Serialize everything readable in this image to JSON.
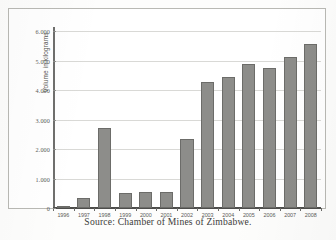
{
  "figure": {
    "caption": "Source: Chamber of Mines of Zimbabwe.",
    "frame_color": "#b9b9b4",
    "background": "#ffffff"
  },
  "chart_data": {
    "type": "bar",
    "title": "",
    "xlabel": "",
    "ylabel": "Volume in kilograms",
    "categories": [
      "1996",
      "1997",
      "1998",
      "1999",
      "2000",
      "2001",
      "2002",
      "2003",
      "2004",
      "2005",
      "2006",
      "2007",
      "2008"
    ],
    "values": [
      30,
      350,
      2730,
      510,
      530,
      540,
      2350,
      4280,
      4450,
      4880,
      4750,
      5130,
      5550
    ],
    "ylim": [
      0,
      6000
    ],
    "ytick_values": [
      0,
      1000,
      2000,
      3000,
      4000,
      5000,
      6000
    ],
    "ytick_labels": [
      "0",
      "1.000",
      "2.000",
      "3.000",
      "4.000",
      "5.000",
      "6.000"
    ],
    "grid": true,
    "legend": "none",
    "bar_color": "#8d8d8a",
    "bar_border_color": "#6c6c69",
    "gridline_color": "#d9d9d6",
    "axis_color": "#4d4d4b"
  }
}
